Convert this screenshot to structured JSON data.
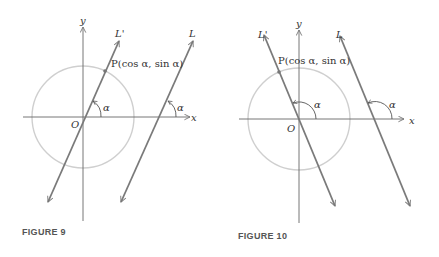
{
  "colors": {
    "axis": "#666666",
    "line": "#7a7a7a",
    "circle": "#cfcfcf",
    "text": "#333333",
    "caption": "#555555"
  },
  "figures": [
    {
      "caption": "FIGURE 9",
      "x_label": "x",
      "y_label": "y",
      "origin_label": "O",
      "line_through_origin_label": "L'",
      "line_label": "L",
      "point_label": "P(cos α, sin α)",
      "angle_label_1": "α",
      "angle_label_2": "α",
      "slope": "positive"
    },
    {
      "caption": "FIGURE 10",
      "x_label": "x",
      "y_label": "y",
      "origin_label": "O",
      "line_through_origin_label": "L'",
      "line_label": "L",
      "point_label": "P(cos α, sin α)",
      "angle_label_1": "α",
      "angle_label_2": "α",
      "slope": "negative"
    }
  ]
}
